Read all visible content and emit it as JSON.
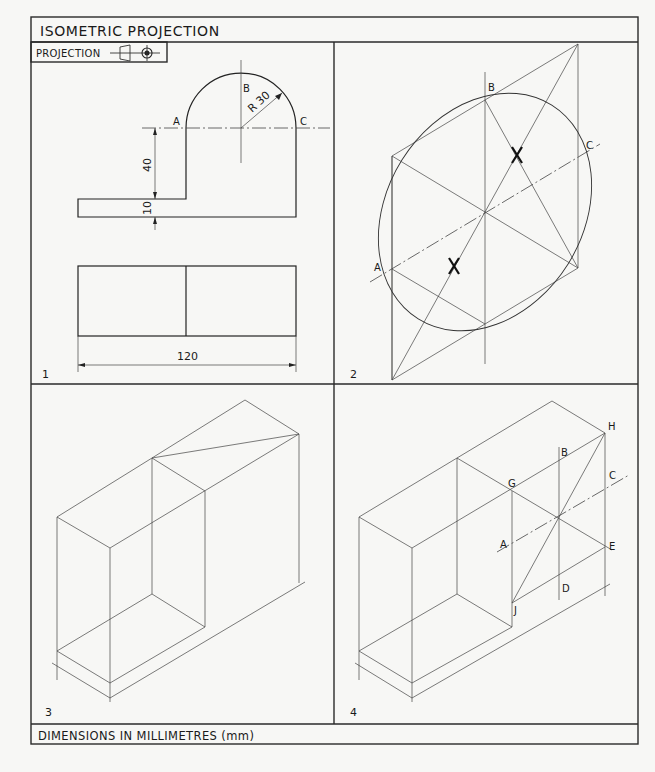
{
  "title": "ISOMETRIC PROJECTION",
  "projection_label": "PROJECTION",
  "projection_symbol": "third-angle-projection-icon",
  "footer": "DIMENSIONS IN MILLIMETRES (mm)",
  "panels": [
    {
      "number": "1",
      "description": "Orthographic views: front elevation with semicircular top and plan",
      "labels": {
        "A": "A",
        "B": "B",
        "C": "C"
      },
      "dimensions": {
        "radius": "R 30",
        "height": "40",
        "thickness": "10",
        "width": "120"
      }
    },
    {
      "number": "2",
      "description": "Isometric ellipse construction in rhombus",
      "labels": {
        "A": "A",
        "B": "B",
        "C": "C"
      }
    },
    {
      "number": "3",
      "description": "Isometric crating box"
    },
    {
      "number": "4",
      "description": "Isometric box with ellipse construction points",
      "labels": {
        "A": "A",
        "B": "B",
        "C": "C",
        "D": "D",
        "E": "E",
        "G": "G",
        "H": "H",
        "J": "J"
      }
    }
  ]
}
